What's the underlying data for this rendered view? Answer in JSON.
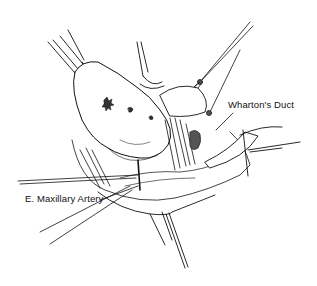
{
  "figure": {
    "labels": {
      "whartons_duct": "Wharton's Duct",
      "maxillary_artery": "E. Maxillary Artery"
    }
  }
}
